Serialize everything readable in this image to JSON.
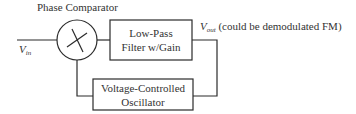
{
  "diagram": {
    "phase_comparator": {
      "label": "Phase Comparator",
      "symbol": "multiplier-x"
    },
    "input": {
      "symbol": "V",
      "subscript": "in"
    },
    "low_pass_filter": {
      "line1": "Low-Pass",
      "line2": "Filter w/Gain"
    },
    "vco": {
      "line1": "Voltage-Controlled",
      "line2": "Oscillator"
    },
    "output": {
      "symbol": "V",
      "subscript": "out",
      "note": "(could be demodulated FM)"
    },
    "colors": {
      "stroke": "#2b2b2b",
      "text": "#333333",
      "background": "#ffffff"
    }
  }
}
